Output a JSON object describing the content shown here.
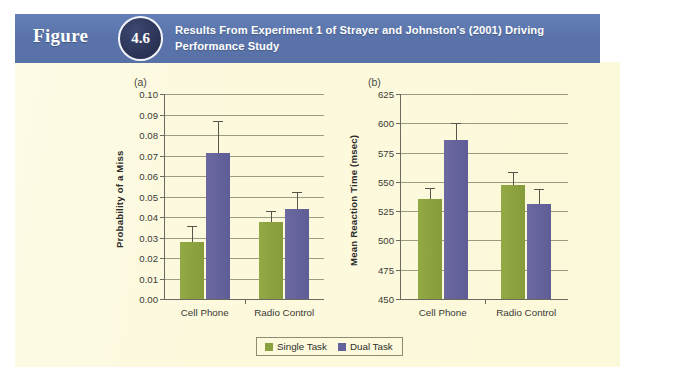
{
  "header": {
    "figure_word": "Figure",
    "figure_number": "4.6",
    "title": "Results From Experiment 1 of Strayer and Johnston's (2001) Driving Performance Study",
    "banner_color": "#5d78ae",
    "badge_color": "#2b3557"
  },
  "colors": {
    "panel_background": "#fcf9dd",
    "single_task": "#8ca23e",
    "dual_task": "#64629d",
    "axis": "#6a6a60",
    "gridline": "#9b9b84"
  },
  "legend": {
    "position": "bottom-center",
    "entries": [
      {
        "label": "Single Task",
        "color": "#8ca23e",
        "swatch": "single"
      },
      {
        "label": "Dual Task",
        "color": "#64629d",
        "swatch": "dual"
      }
    ]
  },
  "chart_data": [
    {
      "panel": "(a)",
      "type": "bar",
      "title": "",
      "xlabel": "",
      "ylabel": "Probability of a Miss",
      "ylim": [
        0.0,
        0.1
      ],
      "ytick_step": 0.01,
      "ytick_labels": [
        "0.00",
        "0.01",
        "0.02",
        "0.03",
        "0.04",
        "0.05",
        "0.06",
        "0.07",
        "0.08",
        "0.09",
        "0.10"
      ],
      "ytick_values": [
        0.0,
        0.01,
        0.02,
        0.03,
        0.04,
        0.05,
        0.06,
        0.07,
        0.08,
        0.09,
        0.1
      ],
      "grid": true,
      "categories": [
        "Cell Phone",
        "Radio Control"
      ],
      "series": [
        {
          "name": "Single Task",
          "color": "#8ca23e",
          "values": [
            0.028,
            0.0375
          ],
          "errors": [
            0.0075,
            0.0055
          ]
        },
        {
          "name": "Dual Task",
          "color": "#64629d",
          "values": [
            0.071,
            0.044
          ],
          "errors": [
            0.016,
            0.008
          ]
        }
      ]
    },
    {
      "panel": "(b)",
      "type": "bar",
      "title": "",
      "xlabel": "",
      "ylabel": "Mean Reaction Time (msec)",
      "ylim": [
        450,
        625
      ],
      "ytick_step": 25,
      "ytick_labels": [
        "450",
        "475",
        "500",
        "525",
        "550",
        "575",
        "600",
        "625"
      ],
      "ytick_values": [
        450,
        475,
        500,
        525,
        550,
        575,
        600,
        625
      ],
      "grid": true,
      "categories": [
        "Cell Phone",
        "Radio Control"
      ],
      "series": [
        {
          "name": "Single Task",
          "color": "#8ca23e",
          "values": [
            535,
            547
          ],
          "errors": [
            10,
            11
          ]
        },
        {
          "name": "Dual Task",
          "color": "#64629d",
          "values": [
            586,
            531
          ],
          "errors": [
            14,
            13
          ]
        }
      ]
    }
  ]
}
